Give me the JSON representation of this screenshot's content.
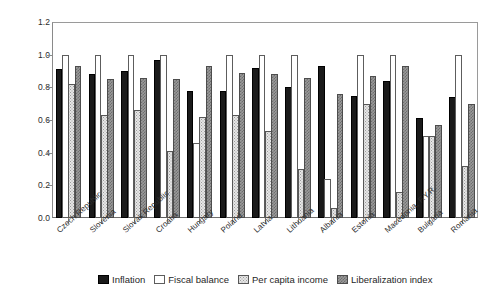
{
  "chart_data": {
    "type": "bar",
    "title": "",
    "subtitle": "",
    "xlabel": "",
    "ylabel": "",
    "ylim": [
      0.0,
      1.2
    ],
    "yticks": [
      "0.0",
      "0.2",
      "0.4",
      "0.6",
      "0.8",
      "1.0",
      "1.2"
    ],
    "grid": false,
    "legend_position": "bottom",
    "categories": [
      "Czech Republic",
      "Slovenia",
      "Slovak Republic",
      "Croatia",
      "Hungary",
      "Poland",
      "Latvia",
      "Lithuania",
      "Albania",
      "Estonia",
      "Macedonia, F.Y.R.",
      "Bulgaria",
      "Romania"
    ],
    "series": [
      {
        "name": "Inflation",
        "color": "#1a1a1a",
        "values": [
          0.91,
          0.88,
          0.9,
          0.97,
          0.78,
          0.78,
          0.92,
          0.8,
          0.93,
          0.75,
          0.84,
          0.61,
          0.74
        ]
      },
      {
        "name": "Fiscal balance",
        "color": "#ffffff",
        "values": [
          1.0,
          1.0,
          1.0,
          1.0,
          0.46,
          1.0,
          1.0,
          1.0,
          0.24,
          1.0,
          1.0,
          0.5,
          1.0
        ]
      },
      {
        "name": "Per capita income",
        "color": "#e6e6e6",
        "values": [
          0.82,
          0.63,
          0.66,
          0.41,
          0.62,
          0.63,
          0.53,
          0.3,
          0.06,
          0.7,
          0.16,
          0.5,
          0.32
        ]
      },
      {
        "name": "Liberalization index",
        "color": "#9a9a9a",
        "values": [
          0.93,
          0.85,
          0.86,
          0.85,
          0.93,
          0.89,
          0.88,
          0.86,
          0.76,
          0.87,
          0.93,
          0.57,
          0.7
        ]
      }
    ]
  },
  "legend": {
    "items": [
      {
        "label": "Inflation"
      },
      {
        "label": "Fiscal balance"
      },
      {
        "label": "Per capita income"
      },
      {
        "label": "Liberalization index"
      }
    ]
  }
}
